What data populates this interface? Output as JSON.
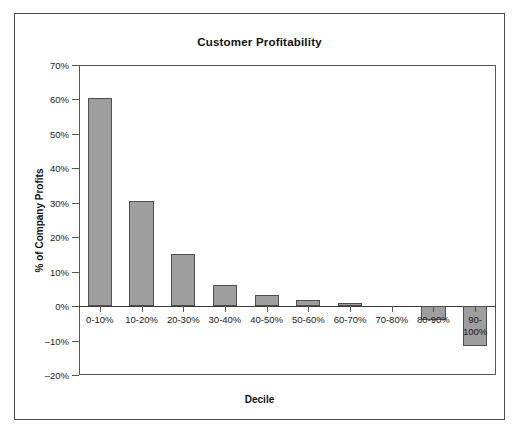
{
  "chart_data": {
    "type": "bar",
    "title": "Customer Profitability",
    "xlabel": "Decile",
    "ylabel": "% of Company Profits",
    "categories": [
      "0-10%",
      "10-20%",
      "20-30%",
      "30-40%",
      "40-50%",
      "50-60%",
      "60-70%",
      "70-80%",
      "80-90%",
      "90-100%"
    ],
    "values": [
      60.5,
      30.5,
      15.2,
      6.1,
      3.1,
      1.8,
      1.0,
      0.0,
      -4.0,
      -11.5
    ],
    "value_labels": [
      "60.5%",
      "30.5%",
      "15.2%",
      "6.1%",
      "3.1%",
      "1.8%",
      "1.0%",
      "0.0%",
      "-4.0%",
      "-11.5%"
    ],
    "ylim": [
      -20,
      70
    ],
    "ytick_values": [
      70,
      60,
      50,
      40,
      30,
      20,
      10,
      0,
      -10,
      -20
    ],
    "ytick_labels": [
      "70%",
      "60%",
      "50%",
      "40%",
      "30%",
      "20%",
      "10%",
      "0%",
      "–10%",
      "–20%"
    ],
    "grid": false,
    "legend": false,
    "bar_color": "#9e9e9e",
    "bar_border_color": "#4f4f4f",
    "axis_color": "#555555",
    "frame_color": "#4a4a4a"
  }
}
